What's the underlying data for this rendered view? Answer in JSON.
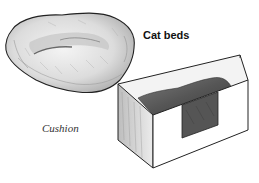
{
  "illustration": {
    "title": "Cat beds",
    "items": [
      {
        "label": "Cushion",
        "type": "cushion"
      },
      {
        "label": "",
        "type": "box-bed"
      }
    ]
  },
  "colors": {
    "background": "#ffffff",
    "ink": "#222222",
    "shade_light": "#d9d9d9",
    "shade_mid": "#9a9a9a",
    "shade_dark": "#4a4a4a"
  }
}
